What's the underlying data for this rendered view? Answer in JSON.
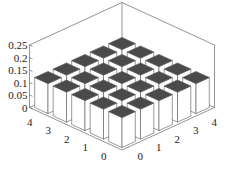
{
  "chart_data": {
    "type": "bar3d",
    "title": "",
    "xlabel": "",
    "ylabel": "",
    "zlabel": "",
    "x_ticks": [
      "0",
      "1",
      "2",
      "3",
      "4"
    ],
    "y_ticks": [
      "0",
      "1",
      "2",
      "3",
      "4"
    ],
    "z_ticks": [
      "0",
      "0.05",
      "0.1",
      "0.15",
      "0.2",
      "0.25"
    ],
    "zlim": [
      0,
      0.25
    ],
    "grid": false,
    "legend": null,
    "x": [
      0,
      1,
      2,
      3,
      4
    ],
    "y": [
      0,
      1,
      2,
      3,
      4
    ],
    "values": [
      [
        0.12,
        0.12,
        0.12,
        0.12,
        0.12
      ],
      [
        0.12,
        0.12,
        0.12,
        0.12,
        0.12
      ],
      [
        0.12,
        0.12,
        0.12,
        0.12,
        0.12
      ],
      [
        0.12,
        0.12,
        0.12,
        0.12,
        0.12
      ],
      [
        0.12,
        0.12,
        0.12,
        0.12,
        0.12
      ]
    ],
    "colors": {
      "top": "#4a4a4a",
      "side": "#ffffff",
      "edge": "#555555",
      "axis": "#666666"
    }
  }
}
